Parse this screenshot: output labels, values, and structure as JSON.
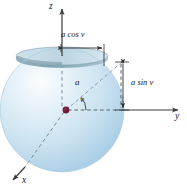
{
  "figure": {
    "name": "sphere-spherical-coordinates-diagram",
    "background": "#ffffff"
  },
  "axes": {
    "z": {
      "label": "z"
    },
    "y": {
      "label": "y"
    },
    "x": {
      "label": "x"
    }
  },
  "labels": {
    "a_cos_v": "a cos v",
    "a_sin_v": "a sin v",
    "radius": "a",
    "angle": "v"
  },
  "colors": {
    "sphere_light": "#f2f8fc",
    "sphere_mid": "#cfe4f2",
    "sphere_dark": "#9cc6e0",
    "disk_top": "#b9d6e2",
    "disk_dark": "#6f8f9c",
    "line": "#3a3a3a",
    "dashed": "#6a6a6a",
    "origin_dot": "#6b1f3a"
  },
  "caption": ""
}
